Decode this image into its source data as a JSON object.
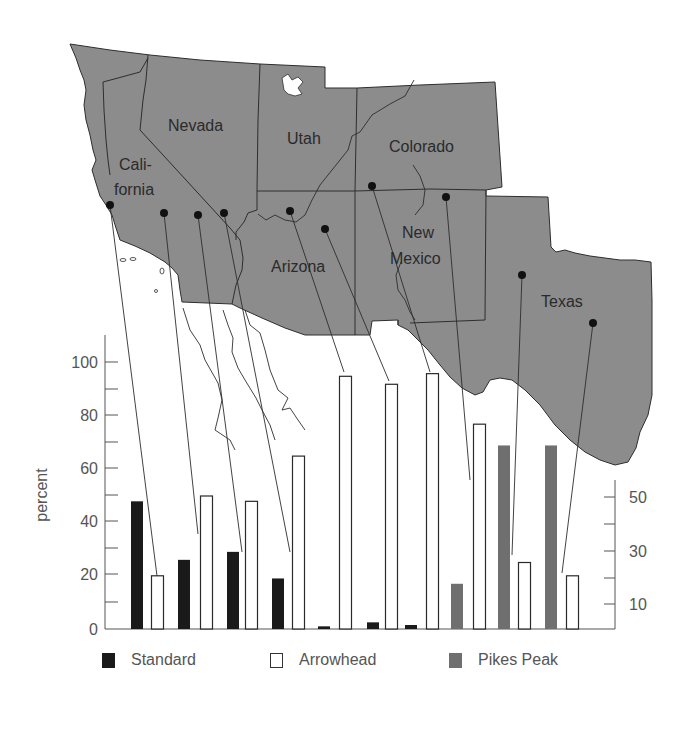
{
  "map": {
    "states": [
      {
        "name": "Nevada",
        "label_lines": [
          "Nevada"
        ]
      },
      {
        "name": "Utah",
        "label_lines": [
          "Utah"
        ]
      },
      {
        "name": "Colorado",
        "label_lines": [
          "Colorado"
        ]
      },
      {
        "name": "California",
        "label_lines": [
          "Cali-",
          "fornia"
        ]
      },
      {
        "name": "Arizona",
        "label_lines": [
          "Arizona"
        ]
      },
      {
        "name": "New Mexico",
        "label_lines": [
          "New",
          "Mexico"
        ]
      },
      {
        "name": "Texas",
        "label_lines": [
          "Texas"
        ]
      }
    ],
    "colors": {
      "land": "#8c8c8c",
      "border": "#2e2e2e",
      "site_dot": "#111111"
    }
  },
  "axes": {
    "left_title": "percent",
    "left_ticks": [
      "0",
      "20",
      "40",
      "60",
      "80",
      "100"
    ],
    "right_ticks": [
      "10",
      "30",
      "50"
    ]
  },
  "legend": {
    "items": [
      {
        "label": "Standard",
        "color": "#1a1a1a",
        "style": "filled"
      },
      {
        "label": "Arrowhead",
        "color": "#ffffff",
        "style": "outline"
      },
      {
        "label": "Pikes Peak",
        "color": "#6f6f6f",
        "style": "filled"
      }
    ]
  },
  "chart_data": {
    "type": "bar",
    "title": "",
    "xlabel": "",
    "ylabel": "percent",
    "ylim": [
      0,
      110
    ],
    "secondary_y_ticks": [
      10,
      30,
      50
    ],
    "grid": false,
    "legend_position": "bottom",
    "categories": [
      "Site 1 (CA coast)",
      "Site 2 (CA)",
      "Site 3 (CA)",
      "Site 4 (CA)",
      "Site 5 (AZ)",
      "Site 6 (AZ)",
      "Site 7 (NM/CO)",
      "Site 8 (NM)",
      "Site 9 (TX)",
      "Site 10 (TX)"
    ],
    "series": [
      {
        "name": "Standard",
        "values": [
          48,
          26,
          29,
          19,
          1,
          2.5,
          1.5,
          null,
          null,
          null
        ]
      },
      {
        "name": "Arrowhead",
        "values": [
          20,
          50,
          48,
          65,
          95,
          92,
          96,
          77,
          25,
          20
        ]
      },
      {
        "name": "Pikes Peak",
        "values": [
          null,
          null,
          null,
          null,
          null,
          null,
          null,
          17,
          69,
          69
        ]
      }
    ],
    "annotations": [
      "Leader lines connect each site dot on the map of the southwestern US to its Arrowhead bar"
    ]
  }
}
